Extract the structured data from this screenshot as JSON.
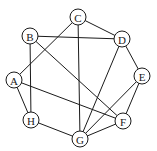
{
  "diagram": {
    "type": "undirected-graph",
    "node_radius": 8,
    "colors": {
      "stroke": "#1a1a1a",
      "fill": "#ffffff",
      "background": "#ffffff"
    },
    "nodes": [
      {
        "id": "A",
        "label": "A",
        "x": 14,
        "y": 80
      },
      {
        "id": "B",
        "label": "B",
        "x": 30,
        "y": 36
      },
      {
        "id": "C",
        "label": "C",
        "x": 78,
        "y": 17
      },
      {
        "id": "D",
        "label": "D",
        "x": 122,
        "y": 39
      },
      {
        "id": "E",
        "label": "E",
        "x": 142,
        "y": 76
      },
      {
        "id": "F",
        "label": "F",
        "x": 123,
        "y": 121
      },
      {
        "id": "G",
        "label": "G",
        "x": 80,
        "y": 139
      },
      {
        "id": "H",
        "label": "H",
        "x": 31,
        "y": 120
      }
    ],
    "edges": [
      [
        "C",
        "D"
      ],
      [
        "C",
        "A"
      ],
      [
        "C",
        "G"
      ],
      [
        "B",
        "D"
      ],
      [
        "B",
        "H"
      ],
      [
        "B",
        "F"
      ],
      [
        "D",
        "E"
      ],
      [
        "D",
        "G"
      ],
      [
        "E",
        "F"
      ],
      [
        "E",
        "G"
      ],
      [
        "A",
        "H"
      ],
      [
        "A",
        "F"
      ],
      [
        "H",
        "G"
      ],
      [
        "F",
        "G"
      ]
    ]
  }
}
